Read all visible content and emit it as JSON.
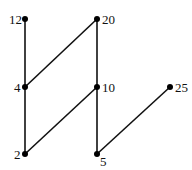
{
  "diagram": {
    "type": "hasse",
    "colors": {
      "line": "#111111",
      "node": "#000000",
      "background": "#ffffff"
    },
    "nodes": [
      {
        "id": "12",
        "label": "12",
        "x": 25,
        "y": 19,
        "lx": 9,
        "ly": 24,
        "anchor": "start"
      },
      {
        "id": "20",
        "label": "20",
        "x": 97,
        "y": 19,
        "lx": 102,
        "ly": 24,
        "anchor": "start"
      },
      {
        "id": "4",
        "label": "4",
        "x": 25,
        "y": 87,
        "lx": 14,
        "ly": 92,
        "anchor": "start"
      },
      {
        "id": "10",
        "label": "10",
        "x": 97,
        "y": 87,
        "lx": 102,
        "ly": 92,
        "anchor": "start"
      },
      {
        "id": "25",
        "label": "25",
        "x": 170,
        "y": 87,
        "lx": 175,
        "ly": 92,
        "anchor": "start"
      },
      {
        "id": "2",
        "label": "2",
        "x": 25,
        "y": 154,
        "lx": 14,
        "ly": 159,
        "anchor": "start"
      },
      {
        "id": "5",
        "label": "5",
        "x": 97,
        "y": 154,
        "lx": 100,
        "ly": 166,
        "anchor": "start"
      }
    ],
    "edges": [
      [
        "12",
        "4"
      ],
      [
        "4",
        "2"
      ],
      [
        "4",
        "20"
      ],
      [
        "20",
        "10"
      ],
      [
        "10",
        "2"
      ],
      [
        "10",
        "5"
      ],
      [
        "5",
        "25"
      ]
    ]
  }
}
